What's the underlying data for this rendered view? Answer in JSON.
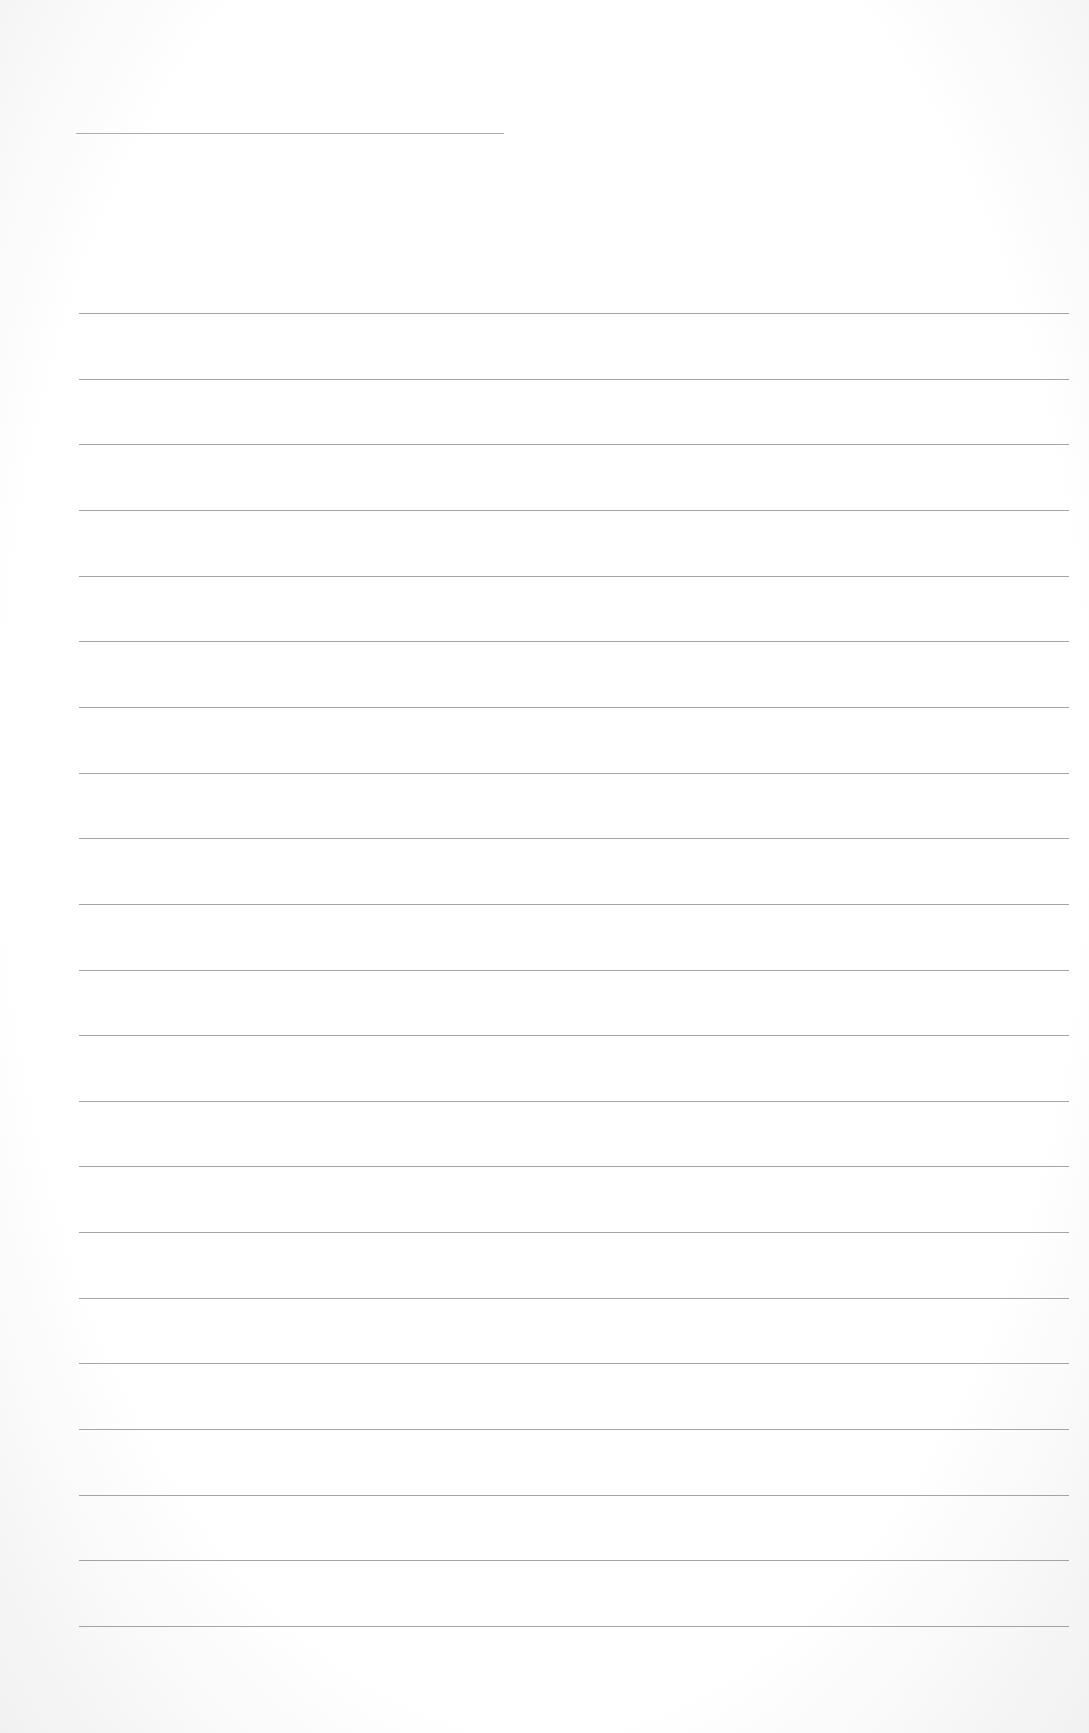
{
  "document": {
    "type": "ruled-sheet",
    "header_line": {
      "present": true
    },
    "ruled_lines": {
      "count": 21
    },
    "text_content": ""
  }
}
